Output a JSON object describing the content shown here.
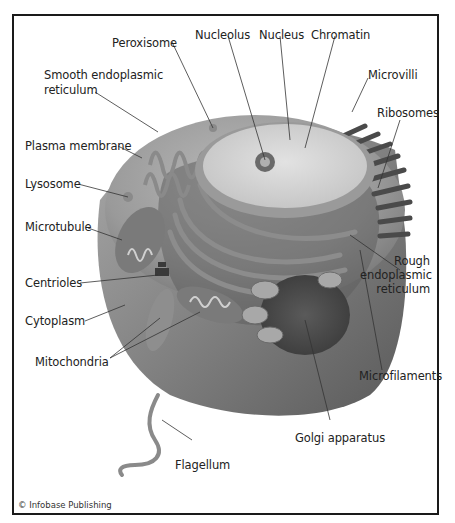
{
  "diagram": {
    "labels": {
      "peroxisome": "Peroxisome",
      "nucleolus": "Nucleolus",
      "nucleus": "Nucleus",
      "chromatin": "Chromatin",
      "smooth_er_line1": "Smooth endoplasmic",
      "smooth_er_line2": "reticulum",
      "microvilli": "Microvilli",
      "ribosomes": "Ribosomes",
      "plasma_membrane": "Plasma membrane",
      "lysosome": "Lysosome",
      "microtubule": "Microtubule",
      "rough_er_line1": "Rough",
      "rough_er_line2": "endoplasmic",
      "rough_er_line3": "reticulum",
      "centrioles": "Centrioles",
      "cytoplasm": "Cytoplasm",
      "mitochondria": "Mitochondria",
      "microfilaments": "Microfilaments",
      "golgi": "Golgi apparatus",
      "flagellum": "Flagellum"
    },
    "copyright": "© Infobase Publishing"
  }
}
